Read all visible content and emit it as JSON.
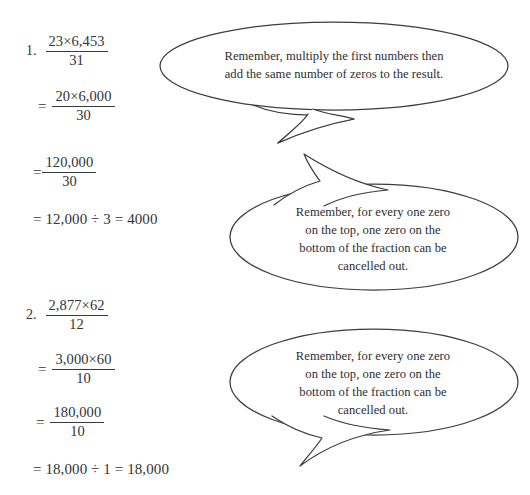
{
  "page": {
    "width": 530,
    "height": 495,
    "background": "#ffffff",
    "ink_color": "#2d2d33",
    "rule_color": "#3a3a3a"
  },
  "problems": [
    {
      "number": "1.",
      "steps": [
        {
          "kind": "fraction",
          "numerator": "23×6,453",
          "denominator": "31",
          "prefix": ""
        },
        {
          "kind": "fraction",
          "numerator": "20×6,000",
          "denominator": "30",
          "prefix": "="
        },
        {
          "kind": "fraction",
          "numerator": "120,000",
          "denominator": "30",
          "prefix": "="
        },
        {
          "kind": "plain",
          "text": "= 12,000 ÷ 3 = 4000"
        }
      ]
    },
    {
      "number": "2.",
      "steps": [
        {
          "kind": "fraction",
          "numerator": "2,877×62",
          "denominator": "12",
          "prefix": ""
        },
        {
          "kind": "fraction",
          "numerator": "3,000×60",
          "denominator": "10",
          "prefix": "="
        },
        {
          "kind": "fraction",
          "numerator": "180,000",
          "denominator": "10",
          "prefix": "="
        },
        {
          "kind": "plain",
          "text": "= 18,000 ÷ 1 = 18,000"
        }
      ]
    }
  ],
  "bubbles": [
    {
      "id": "bubble-multiply-hint",
      "tail_direction": "down-left",
      "lines": [
        "Remember, multiply the first numbers then",
        "add the same number of zeros to the result."
      ]
    },
    {
      "id": "bubble-cancel-zeros-hint-1",
      "tail_direction": "up-left",
      "lines": [
        "Remember, for every one zero",
        "on the top, one zero on the",
        "bottom of the fraction can be",
        "cancelled out."
      ]
    },
    {
      "id": "bubble-cancel-zeros-hint-2",
      "tail_direction": "down-left",
      "lines": [
        "Remember, for every one zero",
        "on the top, one zero on the",
        "bottom of the fraction can be",
        "cancelled out."
      ]
    }
  ]
}
